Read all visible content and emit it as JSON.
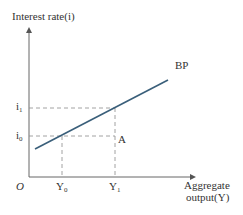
{
  "diagram": {
    "y_axis_label": "Interest rate(i)",
    "x_axis_label_line1": "Aggregate",
    "x_axis_label_line2": "output(Y)",
    "origin_label": "O",
    "curve_label": "BP",
    "point_label": "A",
    "y_ticks": [
      {
        "label": "i",
        "sub": "1"
      },
      {
        "label": "i",
        "sub": "0"
      }
    ],
    "x_ticks": [
      {
        "label": "Y",
        "sub": "0"
      },
      {
        "label": "Y",
        "sub": "1"
      }
    ],
    "colors": {
      "axis": "#555555",
      "curve": "#3a5f7a",
      "guides": "#7a7a7a",
      "text": "#333333"
    }
  }
}
